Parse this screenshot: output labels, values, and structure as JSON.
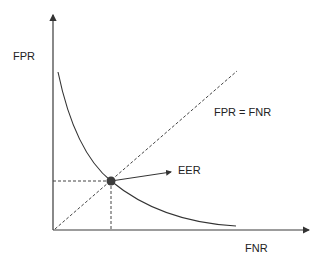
{
  "diagram": {
    "y_axis_label": "FPR",
    "x_axis_label": "FNR",
    "diagonal_label": "FPR = FNR",
    "point_label": "EER",
    "colors": {
      "axis": "#3a3a3a",
      "curve": "#333333",
      "dashed": "#444444",
      "point": "#3c3c3c",
      "text": "#222222"
    }
  }
}
